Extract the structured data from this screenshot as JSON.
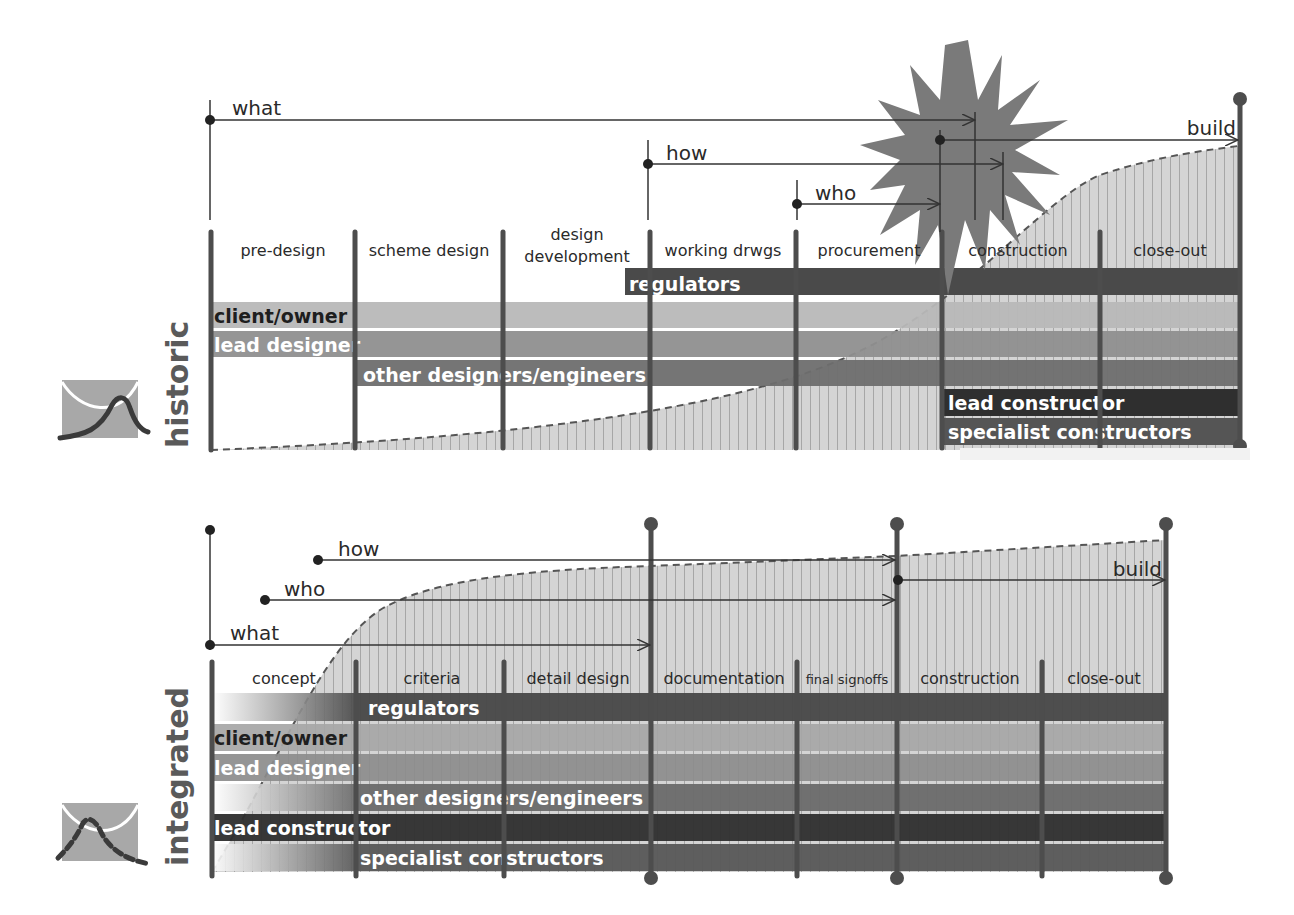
{
  "historic": {
    "side_label": "historic",
    "icon": "bell-curve-peak-icon",
    "arrows": [
      {
        "label": "what",
        "start_x": 210,
        "end_x": 975,
        "y": 120
      },
      {
        "label": "how",
        "start_x": 648,
        "end_x": 1003,
        "y": 164
      },
      {
        "label": "who",
        "start_x": 797,
        "end_x": 940,
        "y": 204
      },
      {
        "label": "build",
        "start_x": 940,
        "end_x": 1238,
        "y": 140
      }
    ],
    "phases": [
      "pre-design",
      "scheme design",
      "design development",
      "working drwgs",
      "procurement",
      "construction",
      "close-out"
    ],
    "phase_dividers_x": [
      211,
      355,
      503,
      650,
      796,
      942,
      1100,
      1240
    ],
    "burst": "starburst-icon",
    "bars": [
      {
        "label": "regulators",
        "start_x": 625,
        "end_x": 1240,
        "color": "#4a4a4a",
        "text_color": "#ffffff"
      },
      {
        "label": "client/owner",
        "start_x": 211,
        "end_x": 1240,
        "color": "#b8b8b8",
        "text_color": "#1e1e1e"
      },
      {
        "label": "lead designer",
        "start_x": 211,
        "end_x": 1240,
        "color": "#8f8f8f",
        "text_color": "#ffffff"
      },
      {
        "label": "other designers/engineers",
        "start_x": 355,
        "end_x": 1240,
        "color": "#6e6e6e",
        "text_color": "#ffffff"
      },
      {
        "label": "lead constructor",
        "start_x": 942,
        "end_x": 1240,
        "color": "#2f2f2f",
        "text_color": "#ffffff"
      },
      {
        "label": "specialist constructors",
        "start_x": 942,
        "end_x": 1240,
        "color": "#555555",
        "text_color": "#ffffff"
      }
    ]
  },
  "integrated": {
    "side_label": "integrated",
    "icon": "dashed-bell-curve-icon",
    "arrows": [
      {
        "label": "how",
        "start_x": 318,
        "end_x": 895,
        "y": 560
      },
      {
        "label": "who",
        "start_x": 265,
        "end_x": 895,
        "y": 600
      },
      {
        "label": "what",
        "start_x": 210,
        "end_x": 651,
        "y": 645
      },
      {
        "label": "build",
        "start_x": 898,
        "end_x": 1165,
        "y": 580
      }
    ],
    "phases": [
      "concept",
      "criteria",
      "detail design",
      "documentation",
      "final signoffs",
      "construction",
      "close-out"
    ],
    "phase_dividers_x": [
      212,
      356,
      504,
      650,
      797,
      897,
      1042,
      1166
    ],
    "bars": [
      {
        "label": "regulators",
        "start_x": 356,
        "end_x": 1166,
        "color": "#474747",
        "text_color": "#ffffff"
      },
      {
        "label": "client/owner",
        "start_x": 212,
        "end_x": 1166,
        "color": "#a6a6a6",
        "text_color": "#1e1e1e"
      },
      {
        "label": "lead designer",
        "start_x": 212,
        "end_x": 1166,
        "color": "#8c8c8c",
        "text_color": "#ffffff"
      },
      {
        "label": "other designers/engineers",
        "start_x": 356,
        "end_x": 1166,
        "color": "#6a6a6a",
        "text_color": "#ffffff"
      },
      {
        "label": "lead constructor",
        "start_x": 212,
        "end_x": 1166,
        "color": "#2e2e2e",
        "text_color": "#ffffff"
      },
      {
        "label": "specialist constructors",
        "start_x": 356,
        "end_x": 1166,
        "color": "#575757",
        "text_color": "#ffffff"
      }
    ]
  },
  "colors": {
    "divider": "#4d4d4d",
    "curve_fill": "#d0d0d0",
    "burst": "#7a7a7a",
    "text": "#2a2a2a"
  }
}
